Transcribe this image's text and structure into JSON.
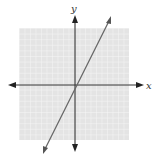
{
  "diagram": {
    "type": "coordinate-plane-graph",
    "axes": {
      "x_label": "x",
      "y_label": "y"
    },
    "grid": {
      "visible": true,
      "cells_per_side": 20
    },
    "line": {
      "description": "straight line with positive slope through near origin, y-intercept slightly below origin"
    },
    "colors": {
      "grid_bg": "#e6e6e6",
      "grid_line": "#f6f6f6",
      "axis": "#333333",
      "graph_line": "#666666"
    }
  }
}
